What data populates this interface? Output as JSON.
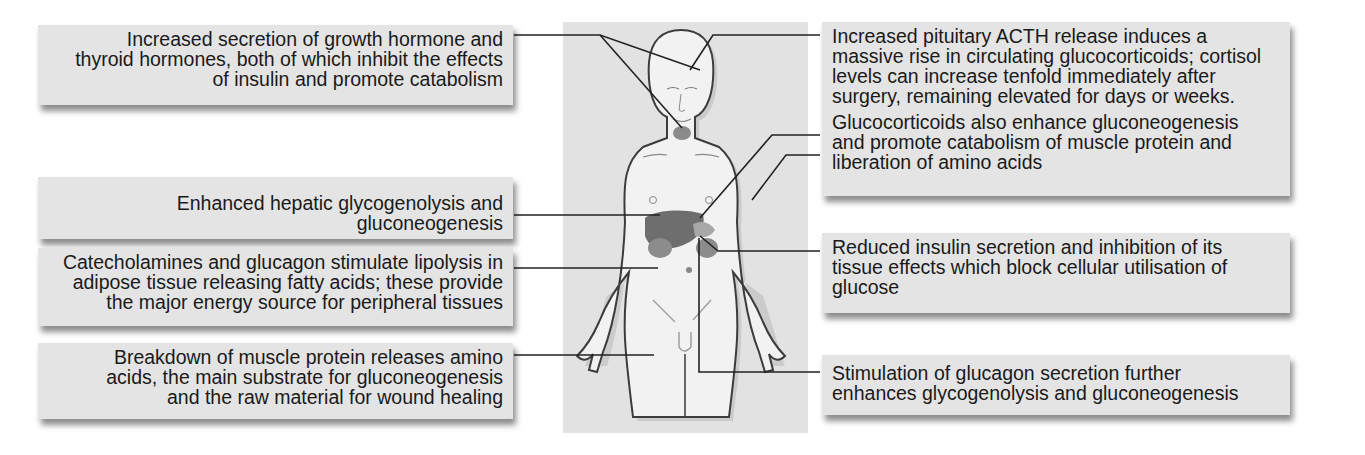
{
  "figure": {
    "colors": {
      "box_bg": "#e4e4e4",
      "panel_bg": "#e2e2e2",
      "text": "#1a1a1a",
      "leader_line": "#222222",
      "organ": "#707070"
    }
  },
  "left_labels": [
    {
      "id": "growth-thyroid",
      "lines": [
        "Increased secretion of growth hormone and",
        "thyroid hormones, both of which inhibit the effects",
        "of insulin and promote catabolism"
      ]
    },
    {
      "id": "hepatic",
      "lines": [
        "Enhanced hepatic glycogenolysis and",
        "gluconeogenesis"
      ]
    },
    {
      "id": "lipolysis",
      "lines": [
        "Catecholamines and glucagon stimulate lipolysis in",
        "adipose tissue releasing fatty acids; these provide",
        "the major energy source for peripheral tissues"
      ]
    },
    {
      "id": "muscle",
      "lines": [
        "Breakdown of muscle protein releases amino",
        "acids, the main substrate for gluconeogenesis",
        "and the raw material for wound healing"
      ]
    }
  ],
  "right_labels": [
    {
      "id": "acth",
      "lines": [
        "Increased pituitary ACTH release induces a",
        "massive rise in circulating glucocorticoids; cortisol",
        "levels can increase tenfold immediately after",
        "surgery, remaining elevated for days or weeks."
      ]
    },
    {
      "id": "glucocorticoids",
      "lines": [
        "Glucocorticoids also enhance gluconeogenesis",
        "and promote catabolism of muscle protein and",
        "liberation of amino acids"
      ]
    },
    {
      "id": "insulin",
      "lines": [
        "Reduced insulin secretion and inhibition of its",
        "tissue effects which block cellular utilisation of",
        "glucose"
      ]
    },
    {
      "id": "glucagon",
      "lines": [
        "Stimulation of glucagon secretion further",
        "enhances glycogenolysis and gluconeogenesis"
      ]
    }
  ]
}
